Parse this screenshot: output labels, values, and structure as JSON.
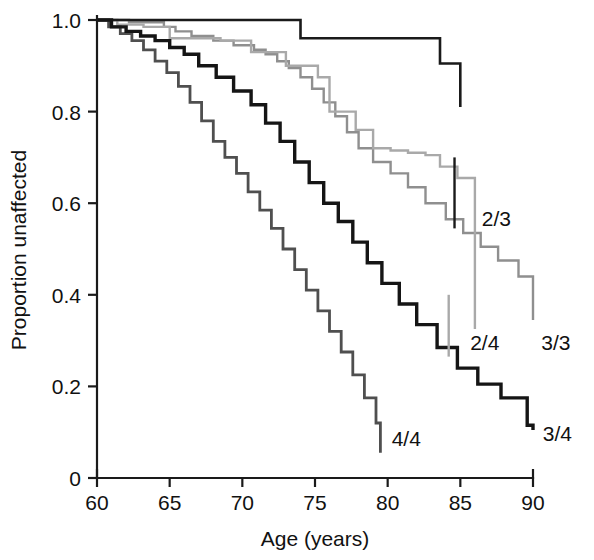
{
  "chart_data": {
    "type": "line",
    "subtype": "kaplan-meier-step",
    "title": "",
    "xlabel": "Age (years)",
    "ylabel": "Proportion unaffected",
    "xlim": [
      60,
      90
    ],
    "ylim": [
      0,
      1.0
    ],
    "xticks": [
      60,
      65,
      70,
      75,
      80,
      85,
      90
    ],
    "xtick_labels": [
      "60",
      "65",
      "70",
      "75",
      "80",
      "85",
      "90"
    ],
    "yticks": [
      0,
      0.2,
      0.4,
      0.6,
      0.8,
      1.0
    ],
    "ytick_labels": [
      "0",
      "0.2",
      "0.4",
      "0.6",
      "0.8",
      "1.0"
    ],
    "grid": false,
    "legend": "inline-end-labels",
    "series": [
      {
        "name": "2/3",
        "color": "#1a1a1a",
        "width": 2.6,
        "label_x": 86.2,
        "label_y": 0.565,
        "leader": {
          "x": 84.6,
          "y1": 0.7,
          "y2": 0.545
        },
        "x": [
          60,
          70.6,
          74.0,
          76.6,
          83.6,
          85.0,
          85.0
        ],
        "y": [
          1.0,
          1.0,
          0.96,
          0.96,
          0.905,
          0.905,
          0.81
        ]
      },
      {
        "name": "3/3",
        "color": "#8f8f8f",
        "width": 2.4,
        "label_x": 90.3,
        "label_y": 0.295,
        "x": [
          60,
          62.2,
          64.6,
          65.4,
          66.5,
          68.0,
          69.4,
          70.8,
          71.6,
          72.4,
          73.2,
          74.0,
          74.8,
          75.6,
          76.4,
          77.2,
          78.0,
          79.0,
          80.2,
          81.4,
          82.6,
          84.0,
          85.2,
          86.4,
          87.6,
          89.0,
          90.0
        ],
        "y": [
          1.0,
          0.995,
          0.985,
          0.975,
          0.965,
          0.955,
          0.945,
          0.935,
          0.925,
          0.91,
          0.895,
          0.875,
          0.85,
          0.82,
          0.79,
          0.755,
          0.72,
          0.69,
          0.665,
          0.635,
          0.6,
          0.565,
          0.535,
          0.505,
          0.475,
          0.44,
          0.345
        ]
      },
      {
        "name": "2/4",
        "color": "#a9a9a9",
        "width": 2.4,
        "label_x": 85.4,
        "label_y": 0.295,
        "leader": {
          "x": 84.2,
          "y1": 0.4,
          "y2": 0.265
        },
        "x": [
          60,
          61.4,
          63.2,
          65.0,
          65.0,
          68.5,
          70.6,
          70.6,
          73.0,
          73.0,
          75.2,
          76.0,
          76.0,
          77.8,
          79.0,
          80.2,
          81.4,
          82.6,
          83.6,
          84.8,
          86.0,
          86.0
        ],
        "y": [
          1.0,
          0.99,
          0.985,
          0.985,
          0.96,
          0.955,
          0.955,
          0.93,
          0.93,
          0.9,
          0.875,
          0.875,
          0.8,
          0.76,
          0.72,
          0.715,
          0.71,
          0.705,
          0.68,
          0.655,
          0.63,
          0.325
        ]
      },
      {
        "name": "3/4",
        "color": "#151515",
        "width": 3.4,
        "label_x": 90.4,
        "label_y": 0.095,
        "x": [
          60,
          61.0,
          62.0,
          63.0,
          64.0,
          65.0,
          66.0,
          67.0,
          68.2,
          69.4,
          70.6,
          71.6,
          72.6,
          73.6,
          74.6,
          75.6,
          76.6,
          77.6,
          78.6,
          79.6,
          80.8,
          82.0,
          83.4,
          84.8,
          86.2,
          87.8,
          89.6,
          90.0
        ],
        "y": [
          1.0,
          0.985,
          0.975,
          0.965,
          0.955,
          0.94,
          0.925,
          0.9,
          0.875,
          0.845,
          0.815,
          0.775,
          0.735,
          0.69,
          0.645,
          0.6,
          0.56,
          0.515,
          0.47,
          0.425,
          0.38,
          0.335,
          0.285,
          0.24,
          0.205,
          0.175,
          0.115,
          0.105
        ]
      },
      {
        "name": "4/4",
        "color": "#4f4f4f",
        "width": 2.8,
        "label_x": 80.0,
        "label_y": 0.085,
        "x": [
          60,
          60.8,
          61.6,
          62.4,
          63.2,
          64.0,
          64.8,
          65.6,
          66.4,
          67.2,
          68.0,
          68.8,
          69.6,
          70.4,
          71.2,
          72.0,
          72.8,
          73.6,
          74.4,
          75.2,
          76.0,
          76.8,
          77.6,
          78.4,
          79.2,
          79.5
        ],
        "y": [
          1.0,
          0.985,
          0.97,
          0.955,
          0.935,
          0.91,
          0.885,
          0.855,
          0.82,
          0.78,
          0.735,
          0.7,
          0.665,
          0.625,
          0.585,
          0.545,
          0.5,
          0.455,
          0.41,
          0.365,
          0.32,
          0.275,
          0.225,
          0.175,
          0.12,
          0.055
        ]
      }
    ]
  },
  "figure": {
    "background": "#ffffff",
    "axis_color": "#1a1a1a",
    "text_color": "#111111"
  }
}
